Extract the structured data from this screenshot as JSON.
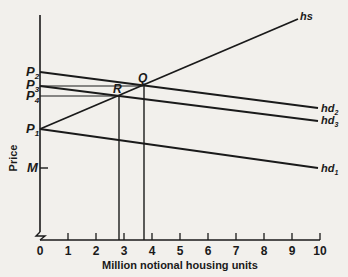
{
  "chart_data": {
    "type": "line",
    "title": "",
    "xlabel": "Million notional housing units",
    "ylabel": "Price",
    "xlim": [
      0,
      10
    ],
    "x_ticks": [
      "0",
      "1",
      "2",
      "3",
      "4",
      "5",
      "6",
      "7",
      "8",
      "9",
      "10"
    ],
    "y_tick_labels": [
      {
        "label": "P2",
        "base": "P",
        "sub": "2",
        "value_px": 72
      },
      {
        "label": "P3",
        "base": "P",
        "sub": "3",
        "value_px": 86
      },
      {
        "label": "P4",
        "base": "P",
        "sub": "4",
        "value_px": 96
      },
      {
        "label": "P1",
        "base": "P",
        "sub": "1",
        "value_px": 129
      },
      {
        "label": "M",
        "base": "M",
        "sub": "",
        "value_px": 168
      }
    ],
    "axis_break": true,
    "grid": false,
    "series": [
      {
        "name": "hs",
        "base": "hs",
        "sub": "",
        "kind": "supply",
        "points": [
          [
            0,
            "P1"
          ],
          [
            9.3,
            "top"
          ]
        ]
      },
      {
        "name": "hd2",
        "base": "hd",
        "sub": "2",
        "kind": "demand",
        "points": [
          [
            0,
            "P2"
          ],
          [
            10,
            "below P4"
          ]
        ]
      },
      {
        "name": "hd3",
        "base": "hd",
        "sub": "3",
        "kind": "demand",
        "points": [
          [
            0,
            "P3"
          ],
          [
            10,
            "between P4 and P1"
          ]
        ]
      },
      {
        "name": "hd1",
        "base": "hd",
        "sub": "1",
        "kind": "demand",
        "points": [
          [
            0,
            "P1"
          ],
          [
            10,
            "M"
          ]
        ]
      }
    ],
    "points": [
      {
        "label": "Q",
        "x": 3.7,
        "price": "P3",
        "desc": "intersection of hs and hd2"
      },
      {
        "label": "R",
        "x": 2.85,
        "price": "P4",
        "desc": "intersection of hs and hd3"
      }
    ],
    "guide_lines": [
      {
        "from": "P3",
        "to": "Q",
        "type": "horizontal"
      },
      {
        "from": "P4",
        "to": "R",
        "type": "horizontal"
      },
      {
        "from": "Q",
        "to": "x-axis",
        "type": "vertical"
      },
      {
        "from": "R",
        "to": "x-axis",
        "type": "vertical"
      }
    ]
  }
}
